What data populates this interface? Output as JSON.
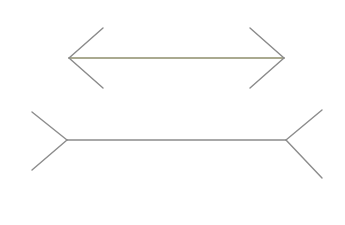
{
  "diagram": {
    "type": "muller-lyer-illusion",
    "canvas": {
      "width": 345,
      "height": 225,
      "background": "#ffffff"
    },
    "figures": [
      {
        "name": "inward-arrow-figure",
        "shaft": {
          "x1": 69,
          "y1": 58,
          "x2": 284,
          "y2": 58,
          "color": "#8f8f6c",
          "width": 1.4
        },
        "fins": [
          {
            "name": "left-upper-fin",
            "x1": 69,
            "y1": 58,
            "x2": 103,
            "y2": 28,
            "color": "#8a8a8a",
            "width": 1.4
          },
          {
            "name": "left-lower-fin",
            "x1": 69,
            "y1": 58,
            "x2": 103,
            "y2": 88,
            "color": "#8a8a8a",
            "width": 1.4
          },
          {
            "name": "right-upper-fin",
            "x1": 284,
            "y1": 58,
            "x2": 250,
            "y2": 28,
            "color": "#8a8a8a",
            "width": 1.4
          },
          {
            "name": "right-lower-fin",
            "x1": 284,
            "y1": 58,
            "x2": 250,
            "y2": 88,
            "color": "#8a8a8a",
            "width": 1.4
          }
        ]
      },
      {
        "name": "outward-fin-figure",
        "shaft": {
          "x1": 67,
          "y1": 140,
          "x2": 286,
          "y2": 140,
          "color": "#8c8c8c",
          "width": 1.4
        },
        "fins": [
          {
            "name": "left-upper-fin",
            "x1": 67,
            "y1": 140,
            "x2": 32,
            "y2": 112,
            "color": "#8c8c8c",
            "width": 1.4
          },
          {
            "name": "left-lower-fin",
            "x1": 67,
            "y1": 140,
            "x2": 32,
            "y2": 170,
            "color": "#8c8c8c",
            "width": 1.4
          },
          {
            "name": "right-upper-fin",
            "x1": 286,
            "y1": 140,
            "x2": 322,
            "y2": 110,
            "color": "#8c8c8c",
            "width": 1.4
          },
          {
            "name": "right-lower-fin",
            "x1": 286,
            "y1": 140,
            "x2": 322,
            "y2": 178,
            "color": "#8c8c8c",
            "width": 1.4
          }
        ]
      }
    ]
  }
}
